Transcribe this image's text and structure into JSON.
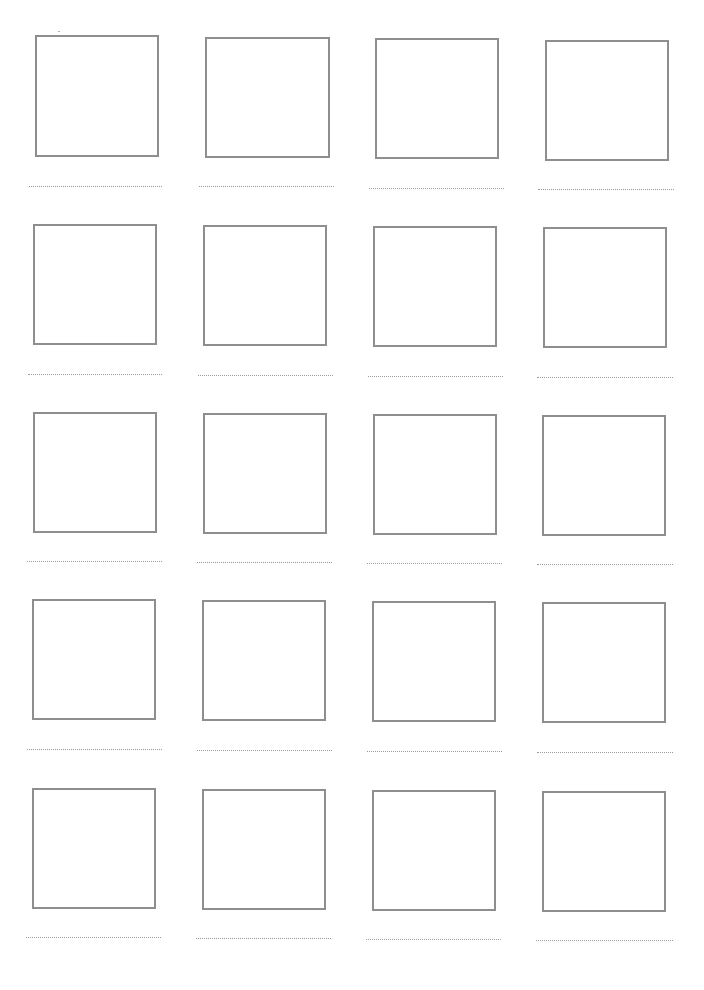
{
  "worksheet": {
    "title": "",
    "layout": {
      "columns": 4,
      "rows": 5
    },
    "border_color": "#8e8e8e",
    "line_color": "#9a9a9a",
    "cells": [
      {
        "row": 1,
        "col": 1,
        "box": [
          35,
          35,
          124,
          122
        ],
        "line": [
          29,
          186,
          133
        ]
      },
      {
        "row": 1,
        "col": 2,
        "box": [
          205,
          37,
          125,
          121
        ],
        "line": [
          199,
          186,
          135
        ]
      },
      {
        "row": 1,
        "col": 3,
        "box": [
          375,
          38,
          124,
          121
        ],
        "line": [
          369,
          188,
          135
        ]
      },
      {
        "row": 1,
        "col": 4,
        "box": [
          545,
          40,
          124,
          121
        ],
        "line": [
          538,
          189,
          136
        ]
      },
      {
        "row": 2,
        "col": 1,
        "box": [
          33,
          224,
          124,
          121
        ],
        "line": [
          28,
          374,
          134
        ]
      },
      {
        "row": 2,
        "col": 2,
        "box": [
          203,
          225,
          124,
          121
        ],
        "line": [
          198,
          375,
          135
        ]
      },
      {
        "row": 2,
        "col": 3,
        "box": [
          373,
          226,
          124,
          121
        ],
        "line": [
          368,
          376,
          135
        ]
      },
      {
        "row": 2,
        "col": 4,
        "box": [
          543,
          227,
          124,
          121
        ],
        "line": [
          537,
          377,
          136
        ]
      },
      {
        "row": 3,
        "col": 1,
        "box": [
          33,
          412,
          124,
          121
        ],
        "line": [
          27,
          561,
          135
        ]
      },
      {
        "row": 3,
        "col": 2,
        "box": [
          203,
          413,
          124,
          121
        ],
        "line": [
          197,
          562,
          135
        ]
      },
      {
        "row": 3,
        "col": 3,
        "box": [
          373,
          414,
          124,
          121
        ],
        "line": [
          367,
          563,
          135
        ]
      },
      {
        "row": 3,
        "col": 4,
        "box": [
          542,
          415,
          124,
          121
        ],
        "line": [
          537,
          564,
          136
        ]
      },
      {
        "row": 4,
        "col": 1,
        "box": [
          32,
          599,
          124,
          121
        ],
        "line": [
          27,
          749,
          135
        ]
      },
      {
        "row": 4,
        "col": 2,
        "box": [
          202,
          600,
          124,
          121
        ],
        "line": [
          197,
          750,
          135
        ]
      },
      {
        "row": 4,
        "col": 3,
        "box": [
          372,
          601,
          124,
          121
        ],
        "line": [
          367,
          751,
          135
        ]
      },
      {
        "row": 4,
        "col": 4,
        "box": [
          542,
          602,
          124,
          121
        ],
        "line": [
          537,
          752,
          136
        ]
      },
      {
        "row": 5,
        "col": 1,
        "box": [
          32,
          788,
          124,
          121
        ],
        "line": [
          26,
          937,
          135
        ]
      },
      {
        "row": 5,
        "col": 2,
        "box": [
          202,
          789,
          124,
          121
        ],
        "line": [
          196,
          938,
          135
        ]
      },
      {
        "row": 5,
        "col": 3,
        "box": [
          372,
          790,
          124,
          121
        ],
        "line": [
          366,
          939,
          135
        ]
      },
      {
        "row": 5,
        "col": 4,
        "box": [
          542,
          791,
          124,
          121
        ],
        "line": [
          536,
          940,
          137
        ]
      }
    ]
  }
}
